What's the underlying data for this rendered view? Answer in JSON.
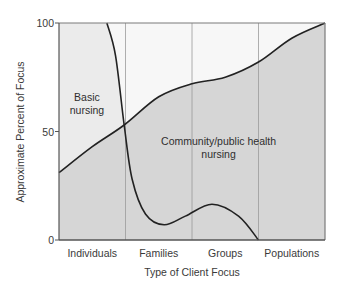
{
  "chart_data": {
    "type": "area",
    "title": "",
    "xlabel": "Type of Client Focus",
    "ylabel": "Approximate Percent of Focus",
    "categories": [
      "Individuals",
      "Families",
      "Groups",
      "Populations"
    ],
    "xlim": [
      0,
      4
    ],
    "ylim": [
      0,
      100
    ],
    "yticks": [
      0,
      50,
      100
    ],
    "ytick_labels": [
      "0",
      "50",
      "100"
    ],
    "grid": "vertical lines between categories",
    "series": [
      {
        "name": "Community/public health nursing",
        "label_lines": [
          "Community/public health",
          "nursing"
        ],
        "fill": "#d6d6d6",
        "points": [
          [
            0,
            31
          ],
          [
            0.5,
            43
          ],
          [
            0.98,
            53
          ],
          [
            1.5,
            66
          ],
          [
            2,
            72
          ],
          [
            2.5,
            75
          ],
          [
            3,
            82
          ],
          [
            3.5,
            93
          ],
          [
            4,
            100
          ]
        ]
      },
      {
        "name": "Basic nursing",
        "label_lines": [
          "Basic",
          "nursing"
        ],
        "fill": "#ebebeb",
        "points": [
          [
            0.72,
            100
          ],
          [
            0.85,
            85
          ],
          [
            0.98,
            53
          ],
          [
            1.1,
            28
          ],
          [
            1.3,
            12
          ],
          [
            1.58,
            7
          ],
          [
            1.9,
            11
          ],
          [
            2.3,
            16.5
          ],
          [
            2.7,
            11
          ],
          [
            3,
            0
          ]
        ]
      }
    ],
    "colors": {
      "basic_region": "#ebebeb",
      "community_region": "#d6d6d6",
      "upper_white_region": "#f7f7f7",
      "curve": "#222222",
      "grid": "#9a9a9a",
      "frame": "#7a7a7a"
    }
  }
}
